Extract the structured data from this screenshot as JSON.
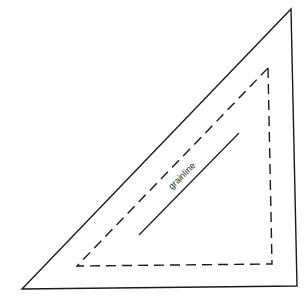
{
  "diagram": {
    "type": "sewing-pattern-piece",
    "shape": "right-triangle",
    "outer_outline": {
      "style": "solid",
      "label": "cutting line"
    },
    "inner_outline": {
      "style": "dashed",
      "label": "seam line"
    },
    "grainline": {
      "label": "grainline",
      "style": "solid"
    },
    "colors": {
      "line": "#1a1a1a",
      "background": "#ffffff"
    }
  }
}
